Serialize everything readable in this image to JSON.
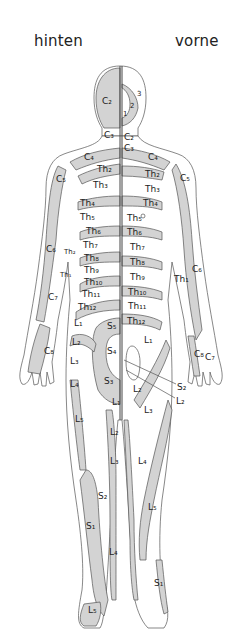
{
  "diagram": {
    "type": "dermatome-map",
    "views": {
      "back": {
        "label": "hinten"
      },
      "front": {
        "label": "vorne"
      }
    },
    "colors": {
      "shaded": "#d3d3d3",
      "unshaded": "#ffffff",
      "outline": "#444444"
    },
    "labels": {
      "back": [
        {
          "id": "C2",
          "text": "C₂",
          "x": 102,
          "y": 104
        },
        {
          "id": "C3",
          "text": "C₃",
          "x": 104,
          "y": 138
        },
        {
          "id": "C4",
          "text": "C₄",
          "x": 84,
          "y": 160
        },
        {
          "id": "C5",
          "text": "C₅",
          "x": 56,
          "y": 182
        },
        {
          "id": "Th2",
          "text": "Th₂",
          "x": 97,
          "y": 172
        },
        {
          "id": "Th3",
          "text": "Th₃",
          "x": 93,
          "y": 188
        },
        {
          "id": "Th4",
          "text": "Th₄",
          "x": 80,
          "y": 206
        },
        {
          "id": "Th5",
          "text": "Th₅",
          "x": 80,
          "y": 220
        },
        {
          "id": "Th6",
          "text": "Th₆",
          "x": 86,
          "y": 232
        },
        {
          "id": "Th7",
          "text": "Th₇",
          "x": 83,
          "y": 246
        },
        {
          "id": "Th8",
          "text": "Th₈",
          "x": 84,
          "y": 258
        },
        {
          "id": "Th9",
          "text": "Th₉",
          "x": 84,
          "y": 270
        },
        {
          "id": "Th10",
          "text": "Th₁₀",
          "x": 84,
          "y": 282
        },
        {
          "id": "Th11",
          "text": "Th₁₁",
          "x": 82,
          "y": 294
        },
        {
          "id": "Th12",
          "text": "Th₁₂",
          "x": 78,
          "y": 308
        },
        {
          "id": "C6",
          "text": "C₆",
          "x": 46,
          "y": 252
        },
        {
          "id": "Th2-arm",
          "text": "Th₂",
          "x": 64,
          "y": 254
        },
        {
          "id": "Th1-arm",
          "text": "Th₁",
          "x": 62,
          "y": 277
        },
        {
          "id": "C7",
          "text": "C₇",
          "x": 48,
          "y": 298
        },
        {
          "id": "C8",
          "text": "C₈",
          "x": 44,
          "y": 352
        },
        {
          "id": "L1",
          "text": "L₁",
          "x": 74,
          "y": 324
        },
        {
          "id": "S5",
          "text": "S₅",
          "x": 107,
          "y": 327
        },
        {
          "id": "L2",
          "text": "L₂",
          "x": 72,
          "y": 343
        },
        {
          "id": "S4",
          "text": "S₄",
          "x": 107,
          "y": 352
        },
        {
          "id": "L3",
          "text": "L₃",
          "x": 70,
          "y": 362
        },
        {
          "id": "S3",
          "text": "S₃",
          "x": 104,
          "y": 382
        },
        {
          "id": "L4",
          "text": "L₄",
          "x": 70,
          "y": 385
        },
        {
          "id": "L5",
          "text": "L₅",
          "x": 75,
          "y": 420
        },
        {
          "id": "L1-leg",
          "text": "L₁",
          "x": 114,
          "y": 403
        },
        {
          "id": "L2-leg",
          "text": "L₂",
          "x": 112,
          "y": 433
        },
        {
          "id": "L3-leg",
          "text": "L₃",
          "x": 112,
          "y": 462
        },
        {
          "id": "S2",
          "text": "S₂",
          "x": 100,
          "y": 497
        },
        {
          "id": "S1",
          "text": "S₁",
          "x": 88,
          "y": 527
        },
        {
          "id": "L4-leg",
          "text": "L₄",
          "x": 111,
          "y": 553
        },
        {
          "id": "L5-foot",
          "text": "L₅",
          "x": 90,
          "y": 611
        }
      ],
      "front": [
        {
          "id": "1",
          "text": "1",
          "x": 123,
          "y": 114
        },
        {
          "id": "2",
          "text": "2",
          "x": 130,
          "y": 106
        },
        {
          "id": "3",
          "text": "3",
          "x": 137,
          "y": 94
        },
        {
          "id": "C2",
          "text": "C₂",
          "x": 124,
          "y": 138
        },
        {
          "id": "C3",
          "text": "C₃",
          "x": 124,
          "y": 149
        },
        {
          "id": "C4",
          "text": "C₄",
          "x": 148,
          "y": 158
        },
        {
          "id": "C5",
          "text": "C₅",
          "x": 180,
          "y": 179
        },
        {
          "id": "Th2",
          "text": "Th₂",
          "x": 145,
          "y": 175
        },
        {
          "id": "Th3",
          "text": "Th₃",
          "x": 145,
          "y": 190
        },
        {
          "id": "Th4",
          "text": "Th₄",
          "x": 143,
          "y": 204
        },
        {
          "id": "Th5",
          "text": "Th₅",
          "x": 127,
          "y": 219
        },
        {
          "id": "Th6",
          "text": "Th₆",
          "x": 127,
          "y": 233
        },
        {
          "id": "Th7",
          "text": "Th₇",
          "x": 130,
          "y": 248
        },
        {
          "id": "Th8",
          "text": "Th₈",
          "x": 130,
          "y": 263
        },
        {
          "id": "Th9",
          "text": "Th₉",
          "x": 130,
          "y": 278
        },
        {
          "id": "Th10",
          "text": "Th₁₀",
          "x": 128,
          "y": 293
        },
        {
          "id": "Th11",
          "text": "Th₁₁",
          "x": 128,
          "y": 307
        },
        {
          "id": "Th12",
          "text": "Th₁₂",
          "x": 127,
          "y": 322
        },
        {
          "id": "C6",
          "text": "C₆",
          "x": 192,
          "y": 270
        },
        {
          "id": "Th1",
          "text": "Th₁",
          "x": 175,
          "y": 280
        },
        {
          "id": "L1",
          "text": "L₁",
          "x": 144,
          "y": 341
        },
        {
          "id": "C8",
          "text": "C₈",
          "x": 196,
          "y": 355
        },
        {
          "id": "C7",
          "text": "C₇",
          "x": 206,
          "y": 358
        },
        {
          "id": "S2",
          "text": "S₂",
          "x": 178,
          "y": 388
        },
        {
          "id": "L2",
          "text": "L₂",
          "x": 133,
          "y": 390
        },
        {
          "id": "L2-tag",
          "text": "L₂",
          "x": 177,
          "y": 402
        },
        {
          "id": "L3",
          "text": "L₃",
          "x": 144,
          "y": 411
        },
        {
          "id": "L4",
          "text": "L₄",
          "x": 139,
          "y": 462
        },
        {
          "id": "L5",
          "text": "L₅",
          "x": 148,
          "y": 508
        },
        {
          "id": "S1",
          "text": "S₁",
          "x": 155,
          "y": 584
        }
      ]
    }
  }
}
